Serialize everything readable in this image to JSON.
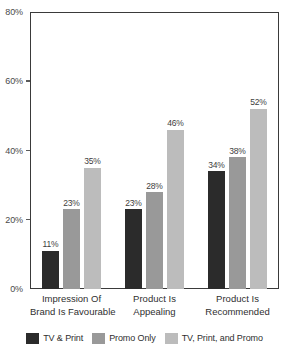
{
  "chart_data": {
    "type": "bar",
    "title": "",
    "subtitle": "",
    "xlabel": "",
    "ylabel": "",
    "ylim": [
      0,
      80
    ],
    "y_ticks": [
      "0%",
      "20%",
      "40%",
      "60%",
      "80%"
    ],
    "y_tick_values": [
      0,
      20,
      40,
      60,
      80
    ],
    "grid": false,
    "legend_position": "bottom",
    "value_suffix": "%",
    "categories": [
      "Impression Of Brand Is Favourable",
      "Product Is Appealing",
      "Product Is Recommended"
    ],
    "category_lines": [
      [
        "Impression Of",
        "Brand Is Favourable"
      ],
      [
        "Product Is",
        "Appealing"
      ],
      [
        "Product Is",
        "Recommended"
      ]
    ],
    "series": [
      {
        "name": "TV & Print",
        "color": "#2b2b2b",
        "values": [
          11,
          23,
          34
        ],
        "labels": [
          "11%",
          "23%",
          "34%"
        ]
      },
      {
        "name": "Promo Only",
        "color": "#999999",
        "values": [
          23,
          28,
          38
        ],
        "labels": [
          "23%",
          "28%",
          "38%"
        ]
      },
      {
        "name": "TV, Print, and Promo",
        "color": "#bcbcbc",
        "values": [
          35,
          46,
          52
        ],
        "labels": [
          "35%",
          "46%",
          "52%"
        ]
      }
    ],
    "data_by_category": [
      {
        "category": "Impression Of Brand Is Favourable",
        "TV & Print": 11,
        "Promo Only": 23,
        "TV, Print, and Promo": 35
      },
      {
        "category": "Product Is Appealing",
        "TV & Print": 28,
        "Promo Only": 28,
        "TV, Print, and Promo": 46
      },
      {
        "category": "Product Is Recommended",
        "TV & Print": 34,
        "Promo Only": 38,
        "TV, Print, and Promo": 52
      }
    ]
  },
  "legend": {
    "items": [
      {
        "label": "TV & Print",
        "color": "#2b2b2b"
      },
      {
        "label": "Promo Only",
        "color": "#999999"
      },
      {
        "label": "TV, Print, and Promo",
        "color": "#bcbcbc"
      }
    ]
  },
  "colors": {
    "axis": "#3a3a3a",
    "tick_text": "#4a4a4a",
    "label_text": "#2f2f2f",
    "background": "#ffffff"
  }
}
